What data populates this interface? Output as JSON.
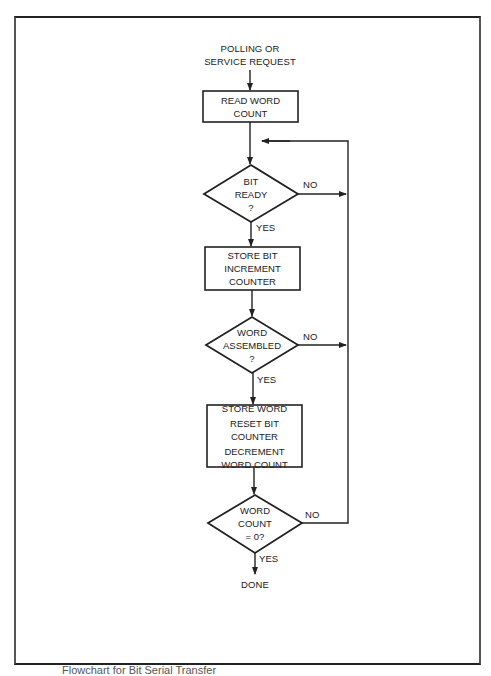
{
  "flowchart": {
    "start": {
      "lines": [
        "POLLING OR",
        "SERVICE REQUEST"
      ]
    },
    "nodes": [
      {
        "id": "read-word-count",
        "type": "process",
        "lines": [
          "READ WORD",
          "COUNT"
        ]
      },
      {
        "id": "bit-ready",
        "type": "decision",
        "lines": [
          "BIT",
          "READY",
          "?"
        ],
        "yes": "YES",
        "no": "NO"
      },
      {
        "id": "store-bit",
        "type": "process",
        "lines": [
          "STORE BIT",
          "INCREMENT",
          "COUNTER"
        ]
      },
      {
        "id": "word-assembled",
        "type": "decision",
        "lines": [
          "WORD",
          "ASSEMBLED",
          "?"
        ],
        "yes": "YES",
        "no": "NO"
      },
      {
        "id": "store-word",
        "type": "process",
        "lines": [
          "STORE WORD",
          "RESET BIT",
          "COUNTER",
          "DECREMENT",
          "WORD COUNT"
        ]
      },
      {
        "id": "word-count-zero",
        "type": "decision",
        "lines": [
          "WORD",
          "COUNT",
          "= 0?"
        ],
        "yes": "YES",
        "no": "NO"
      }
    ],
    "end": {
      "label": "DONE"
    }
  },
  "caption": "Flowchart for Bit Serial Transfer",
  "colors": {
    "line": "#222222",
    "background": "#ffffff"
  }
}
